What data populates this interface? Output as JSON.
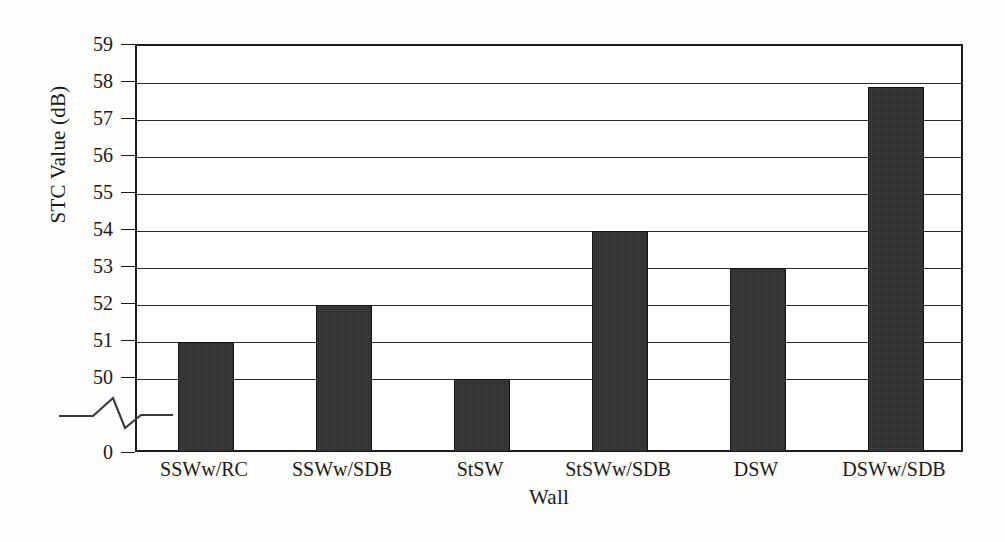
{
  "chart_data": {
    "type": "bar",
    "title": "",
    "xlabel": "Wall",
    "ylabel": "STC Value (dB)",
    "categories": [
      "SSWw/RC",
      "SSWw/SDB",
      "StSW",
      "StSWw/SDB",
      "DSW",
      "DSWw/SDB"
    ],
    "values": [
      51,
      52,
      50,
      54,
      53,
      57.9
    ],
    "ylim": [
      49.2,
      59
    ],
    "y_axis_break": true,
    "y_break_note": "axis broken between 0 and the lower plot limit",
    "yticks": [
      "0",
      "50",
      "51",
      "52",
      "53",
      "54",
      "55",
      "56",
      "57",
      "58",
      "59"
    ],
    "grid": true,
    "grid_axis": "y",
    "legend": null,
    "bar_color": "#2a2a2a",
    "axis_color": "#1c1c1c",
    "background": "#ffffff"
  },
  "axis": {
    "ylabel": "STC Value (dB)",
    "xlabel": "Wall"
  },
  "yticks": [
    {
      "label": "59",
      "value": 59
    },
    {
      "label": "58",
      "value": 58
    },
    {
      "label": "57",
      "value": 57
    },
    {
      "label": "56",
      "value": 56
    },
    {
      "label": "55",
      "value": 55
    },
    {
      "label": "54",
      "value": 54
    },
    {
      "label": "53",
      "value": 53
    },
    {
      "label": "52",
      "value": 52
    },
    {
      "label": "51",
      "value": 51
    },
    {
      "label": "50",
      "value": 50
    },
    {
      "label": "0",
      "value": 0
    }
  ],
  "bars": [
    {
      "label": "SSWw/RC",
      "value": 51
    },
    {
      "label": "SSWw/SDB",
      "value": 52
    },
    {
      "label": "StSW",
      "value": 50
    },
    {
      "label": "StSWw/SDB",
      "value": 54
    },
    {
      "label": "DSW",
      "value": 53
    },
    {
      "label": "DSWw/SDB",
      "value": 57.9
    }
  ]
}
